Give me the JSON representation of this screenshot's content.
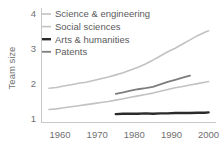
{
  "chart_data": {
    "type": "line",
    "title": "",
    "subtitle": "",
    "xlabel": "",
    "ylabel": "Team size",
    "xlim": [
      1955,
      2002
    ],
    "ylim": [
      0.88,
      4.15
    ],
    "xticks": [
      1960,
      1970,
      1980,
      1990,
      2000
    ],
    "xtick_labels": [
      "1960",
      "1970",
      "1980",
      "1990",
      "2000"
    ],
    "yticks": [
      1,
      2,
      3,
      4
    ],
    "ytick_labels": [
      "1",
      "2",
      "3",
      "4"
    ],
    "grid": false,
    "legend_position": "upper left",
    "series": [
      {
        "name": "Science & engineering",
        "color": "#c2c2c2",
        "linewidth": 1.6,
        "x": [
          1957,
          1959,
          1961,
          1963,
          1965,
          1967,
          1969,
          1971,
          1973,
          1975,
          1977,
          1979,
          1981,
          1983,
          1985,
          1987,
          1989,
          1991,
          1993,
          1995,
          1997,
          1999,
          2000
        ],
        "values": [
          1.86,
          1.88,
          1.92,
          1.96,
          2.0,
          2.03,
          2.08,
          2.13,
          2.18,
          2.24,
          2.3,
          2.38,
          2.46,
          2.55,
          2.66,
          2.78,
          2.9,
          3.0,
          3.12,
          3.24,
          3.36,
          3.46,
          3.5
        ]
      },
      {
        "name": "Social sciences",
        "color": "#c2c2c2",
        "linewidth": 1.6,
        "x": [
          1957,
          1959,
          1961,
          1963,
          1965,
          1967,
          1969,
          1971,
          1973,
          1975,
          1977,
          1979,
          1981,
          1983,
          1985,
          1987,
          1989,
          1991,
          1993,
          1995,
          1997,
          1999,
          2000
        ],
        "values": [
          1.25,
          1.27,
          1.3,
          1.33,
          1.36,
          1.39,
          1.42,
          1.45,
          1.48,
          1.52,
          1.56,
          1.6,
          1.64,
          1.68,
          1.72,
          1.77,
          1.82,
          1.87,
          1.91,
          1.95,
          1.99,
          2.03,
          2.05
        ]
      },
      {
        "name": "Arts & humanities",
        "color": "#2b2b2b",
        "linewidth": 2.4,
        "x": [
          1975,
          1977,
          1979,
          1981,
          1983,
          1985,
          1987,
          1989,
          1991,
          1993,
          1995,
          1997,
          1999,
          2000
        ],
        "values": [
          1.12,
          1.13,
          1.13,
          1.13,
          1.14,
          1.13,
          1.14,
          1.14,
          1.15,
          1.15,
          1.15,
          1.16,
          1.16,
          1.17
        ]
      },
      {
        "name": "Patents",
        "color": "#7d7d7d",
        "linewidth": 1.8,
        "x": [
          1975,
          1977,
          1979,
          1981,
          1983,
          1985,
          1987,
          1989,
          1991,
          1993,
          1995
        ],
        "values": [
          1.7,
          1.74,
          1.79,
          1.83,
          1.86,
          1.9,
          1.97,
          2.04,
          2.1,
          2.16,
          2.22
        ]
      }
    ]
  },
  "axes": {
    "y_axis_title": "Team size",
    "ytick_labels": [
      "4",
      "3",
      "2",
      "1"
    ],
    "xtick_labels": [
      "1960",
      "1970",
      "1980",
      "1990",
      "2000"
    ]
  },
  "legend": {
    "items": [
      {
        "label": "Science & engineering",
        "color": "#c2c2c2",
        "marker": "dash-icon"
      },
      {
        "label": "Social sciences",
        "color": "#c2c2c2",
        "marker": "dash-icon"
      },
      {
        "label": "Arts & humanities",
        "color": "#2b2b2b",
        "marker": "dash-icon"
      },
      {
        "label": "Patents",
        "color": "#7d7d7d",
        "marker": "dash-icon"
      }
    ]
  },
  "colors": {
    "background": "#ffffff",
    "axis": "#c9c9c9",
    "tick_text": "#6f6f6f",
    "legend_text": "#5a5a5a"
  }
}
